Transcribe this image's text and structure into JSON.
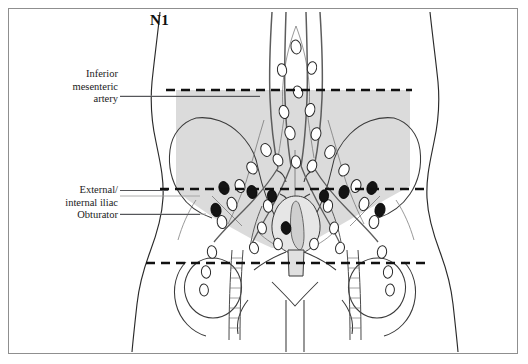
{
  "figure": {
    "title": "N1",
    "type": "anatomical-illustration",
    "frame_border_color": "#8f8f8f",
    "background_color": "#ffffff"
  },
  "labels": [
    {
      "id": "inferior-mesenteric-artery",
      "lines": [
        "Inferior",
        "mesenteric",
        "artery"
      ],
      "text": "Inferior mesenteric artery",
      "has_leader_line": true
    },
    {
      "id": "external-internal-iliac",
      "lines": [
        "External/",
        "internal iliac"
      ],
      "text": "External/internal iliac",
      "has_leader_line": true
    },
    {
      "id": "obturator",
      "lines": [
        "Obturator"
      ],
      "text": "Obturator",
      "has_leader_line": true
    }
  ],
  "level_markers": [
    {
      "id": "inferior-mesenteric-artery-level",
      "style": "dashed",
      "y": 90
    },
    {
      "id": "iliac-bifurcation-level",
      "style": "dashed",
      "y": 189
    },
    {
      "id": "inguinal-level",
      "style": "dashed",
      "y": 263
    }
  ],
  "regions": [
    {
      "id": "nodal-drainage-field",
      "description": "shaded regional nodal basin",
      "fill": "#d9d9d9",
      "opacity": 0.9
    }
  ],
  "nodes": {
    "uninvolved_color": "#ffffff",
    "involved_color": "#141414",
    "outline_color": "#2a2a2a",
    "uninvolved_count": 34,
    "involved_count": 9
  },
  "colors": {
    "line": "#2a2a2a",
    "thin_line": "#6d6d6d",
    "shade": "#d9d9d9",
    "vessel": "#5d5d5d",
    "dashed": "#111111",
    "leader": "#55565a",
    "text": "#1a1a1a"
  }
}
